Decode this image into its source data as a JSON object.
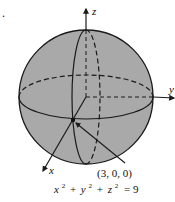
{
  "figure": {
    "marker": ".",
    "axes": {
      "x_label": "x",
      "y_label": "y",
      "z_label": "z"
    },
    "point": {
      "label": "(3, 0, 0)"
    },
    "equation": {
      "x": "x",
      "y": "y",
      "z": "z",
      "exp": "2",
      "plus": "+",
      "equals": "= 9"
    },
    "colors": {
      "sphere_fill": "#a9a9a9",
      "stroke": "#1a1a1a",
      "background": "#ffffff"
    }
  }
}
